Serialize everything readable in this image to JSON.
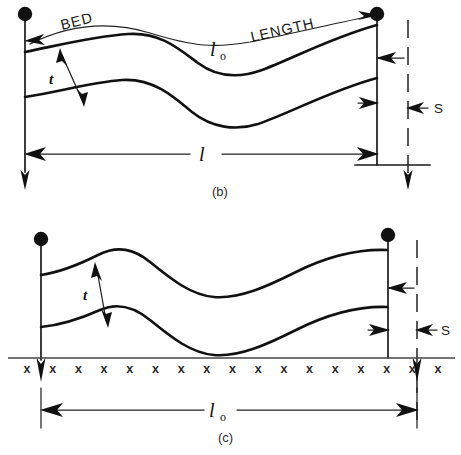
{
  "figure": {
    "background_color": "#ffffff",
    "ink_color": "#111111",
    "panels": [
      {
        "id": "b",
        "caption": "(b)",
        "labels": {
          "bed": "BED",
          "length": "LENGTH",
          "bed_length_symbol": "l",
          "bed_length_subscript": "o",
          "thickness": "t",
          "span_symbol": "l",
          "slip": "S"
        }
      },
      {
        "id": "c",
        "caption": "(c)",
        "labels": {
          "thickness": "t",
          "bed_length_symbol": "l",
          "bed_length_subscript": "o",
          "slip": "S",
          "hatch_mark": "x",
          "hatch_mark_count": 17
        }
      }
    ]
  },
  "panel_b": {
    "caption": "(b)",
    "bed_label": "BED",
    "length_label": "LENGTH",
    "l0_symbol": "l",
    "l0_sub": "o",
    "t_label": "t",
    "l_symbol": "l",
    "s_label": "S"
  },
  "panel_c": {
    "caption": "(c)",
    "t_label": "t",
    "l0_symbol": "l",
    "l0_sub": "o",
    "s_label": "S",
    "hatch_marks": [
      "x",
      "x",
      "x",
      "x",
      "x",
      "x",
      "x",
      "x",
      "x",
      "x",
      "x",
      "x",
      "x",
      "x",
      "x",
      "x",
      "x"
    ]
  }
}
